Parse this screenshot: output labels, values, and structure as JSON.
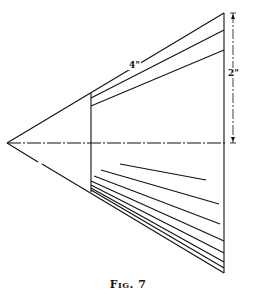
{
  "figure": {
    "caption": "Fig. 7",
    "labels": {
      "slant_length": "4\"",
      "height": "2\""
    },
    "colors": {
      "ink": "#111111",
      "paper": "#ffffff"
    }
  }
}
